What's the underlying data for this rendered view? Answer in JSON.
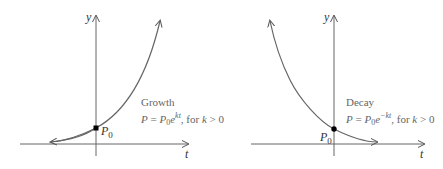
{
  "growth": {
    "y_axis_label": "y",
    "x_axis_label": "t",
    "point_label": "P",
    "point_subscript": "0",
    "title": "Growth",
    "formula_lhs": "P = ",
    "formula_coeff": "P",
    "formula_coeff_sub": "0",
    "formula_base": "e",
    "formula_exponent": "kt",
    "formula_condition": ", for k > 0"
  },
  "decay": {
    "y_axis_label": "y",
    "x_axis_label": "t",
    "point_label": "P",
    "point_subscript": "0",
    "title": "Decay",
    "formula_lhs": "P = ",
    "formula_coeff": "P",
    "formula_coeff_sub": "0",
    "formula_base": "e",
    "formula_exponent": "−kt",
    "formula_condition": ", for k > 0"
  },
  "colors": {
    "axis": "#555555",
    "curve": "#666666",
    "point": "#000000",
    "caption": "#666666"
  }
}
